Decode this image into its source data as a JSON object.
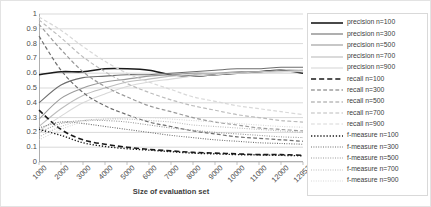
{
  "chart_data": {
    "type": "line",
    "title": "",
    "xlabel": "Size of evaluation set",
    "ylabel": "",
    "grid": true,
    "legend_position": "right",
    "ylim": [
      0,
      1
    ],
    "yticks": [
      "1",
      "0.9",
      "0.8",
      "0.7",
      "0.6",
      "0.5",
      "0.4",
      "0.3",
      "0.2",
      "0.1",
      "0"
    ],
    "ytick_values": [
      1,
      0.9,
      0.8,
      0.7,
      0.6,
      0.5,
      0.4,
      0.3,
      0.2,
      0.1,
      0
    ],
    "categories": [
      "1000",
      "2000",
      "3000",
      "4000",
      "5000",
      "6000",
      "7000",
      "8000",
      "9000",
      "10000",
      "11000",
      "12000",
      "12953"
    ],
    "x_values": [
      1000,
      2000,
      3000,
      4000,
      5000,
      6000,
      7000,
      8000,
      9000,
      10000,
      11000,
      12000,
      12953
    ],
    "series": [
      {
        "name": "precision n=100",
        "style": "solid",
        "color": "#1a1a1a",
        "width": 1.6,
        "values": [
          0.59,
          0.61,
          0.61,
          0.63,
          0.63,
          0.62,
          0.59,
          0.58,
          0.59,
          0.6,
          0.61,
          0.62,
          0.6
        ]
      },
      {
        "name": "precision n=300",
        "style": "solid",
        "color": "#6e6e6e",
        "width": 1.1,
        "values": [
          0.4,
          0.52,
          0.57,
          0.58,
          0.59,
          0.59,
          0.6,
          0.61,
          0.62,
          0.63,
          0.63,
          0.64,
          0.64
        ]
      },
      {
        "name": "precision n=500",
        "style": "solid",
        "color": "#9a9a9a",
        "width": 1.1,
        "values": [
          0.29,
          0.43,
          0.5,
          0.54,
          0.56,
          0.58,
          0.59,
          0.6,
          0.6,
          0.61,
          0.61,
          0.62,
          0.62
        ]
      },
      {
        "name": "precision n=700",
        "style": "solid",
        "color": "#bcbcbc",
        "width": 1.1,
        "values": [
          0.24,
          0.36,
          0.45,
          0.5,
          0.54,
          0.56,
          0.58,
          0.59,
          0.6,
          0.6,
          0.61,
          0.61,
          0.62
        ]
      },
      {
        "name": "precision n=900",
        "style": "solid",
        "color": "#d8d8d8",
        "width": 1.1,
        "values": [
          0.21,
          0.31,
          0.4,
          0.46,
          0.51,
          0.54,
          0.56,
          0.58,
          0.59,
          0.6,
          0.6,
          0.61,
          0.61
        ]
      },
      {
        "name": "recall n=100",
        "style": "dashed",
        "color": "#1a1a1a",
        "width": 1.6,
        "values": [
          0.35,
          0.22,
          0.15,
          0.12,
          0.1,
          0.085,
          0.075,
          0.065,
          0.06,
          0.055,
          0.05,
          0.05,
          0.045
        ]
      },
      {
        "name": "recall n=300",
        "style": "dashed",
        "color": "#6e6e6e",
        "width": 1.2,
        "values": [
          0.85,
          0.62,
          0.47,
          0.38,
          0.32,
          0.27,
          0.24,
          0.21,
          0.19,
          0.17,
          0.16,
          0.15,
          0.14
        ]
      },
      {
        "name": "recall n=500",
        "style": "dashed",
        "color": "#9a9a9a",
        "width": 1.2,
        "values": [
          0.93,
          0.76,
          0.61,
          0.51,
          0.44,
          0.38,
          0.34,
          0.3,
          0.27,
          0.25,
          0.23,
          0.22,
          0.21
        ]
      },
      {
        "name": "recall n=700",
        "style": "dashed",
        "color": "#bcbcbc",
        "width": 1.2,
        "values": [
          0.96,
          0.84,
          0.71,
          0.61,
          0.53,
          0.47,
          0.42,
          0.38,
          0.35,
          0.32,
          0.3,
          0.28,
          0.27
        ]
      },
      {
        "name": "recall n=900",
        "style": "dashed",
        "color": "#d8d8d8",
        "width": 1.2,
        "values": [
          0.98,
          0.89,
          0.78,
          0.68,
          0.6,
          0.54,
          0.49,
          0.44,
          0.41,
          0.38,
          0.36,
          0.34,
          0.32
        ]
      },
      {
        "name": "f-measure n=100",
        "style": "dotted",
        "color": "#1a1a1a",
        "width": 1.4,
        "values": [
          0.22,
          0.18,
          0.13,
          0.105,
          0.09,
          0.08,
          0.07,
          0.06,
          0.055,
          0.05,
          0.048,
          0.045,
          0.042
        ]
      },
      {
        "name": "f-measure n=300",
        "style": "dotted",
        "color": "#6e6e6e",
        "width": 1.1,
        "values": [
          0.23,
          0.27,
          0.26,
          0.24,
          0.22,
          0.2,
          0.18,
          0.165,
          0.15,
          0.14,
          0.13,
          0.125,
          0.12
        ]
      },
      {
        "name": "f-measure n=500",
        "style": "dotted",
        "color": "#9a9a9a",
        "width": 1.1,
        "values": [
          0.2,
          0.26,
          0.28,
          0.28,
          0.27,
          0.25,
          0.23,
          0.215,
          0.2,
          0.19,
          0.18,
          0.17,
          0.165
        ]
      },
      {
        "name": "f-measure n=700",
        "style": "dotted",
        "color": "#bcbcbc",
        "width": 1.1,
        "values": [
          0.17,
          0.24,
          0.28,
          0.29,
          0.29,
          0.28,
          0.27,
          0.25,
          0.24,
          0.23,
          0.22,
          0.21,
          0.2
        ]
      },
      {
        "name": "f-measure n=900",
        "style": "dotted",
        "color": "#d8d8d8",
        "width": 1.1,
        "values": [
          0.15,
          0.22,
          0.27,
          0.29,
          0.3,
          0.3,
          0.29,
          0.28,
          0.27,
          0.26,
          0.25,
          0.24,
          0.235
        ]
      }
    ]
  },
  "legend": {
    "items": [
      "precision n=100",
      "precision n=300",
      "precision n=500",
      "precision n=700",
      "precision n=900",
      "recall n=100",
      "recall n=300",
      "recall n=500",
      "recall n=700",
      "recall n=900",
      "f-measure n=100",
      "f-measure n=300",
      "f-measure n=500",
      "f-measure n=700",
      "f-measure n=900"
    ]
  },
  "colors": {
    "grid": "#bfbfbf",
    "axis": "#9a9a9a",
    "text": "#3d3d3d",
    "frame": "#d9d9d9"
  }
}
